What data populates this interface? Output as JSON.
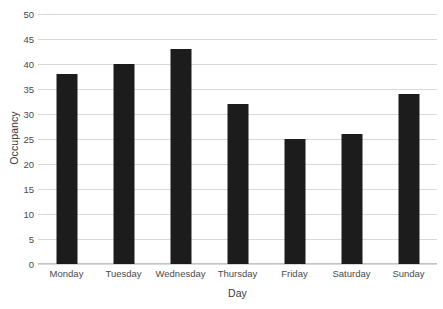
{
  "chart_data": {
    "type": "bar",
    "title": "",
    "xlabel": "Day",
    "ylabel": "Occupancy",
    "categories": [
      "Monday",
      "Tuesday",
      "Wednesday",
      "Thursday",
      "Friday",
      "Saturday",
      "Sunday"
    ],
    "values": [
      38,
      40,
      43,
      32,
      25,
      26,
      34
    ],
    "ylim": [
      0,
      50
    ],
    "yticks": [
      0,
      5,
      10,
      15,
      20,
      25,
      30,
      35,
      40,
      45,
      50
    ],
    "ytick_labels": [
      "0",
      "5",
      "10",
      "15",
      "20",
      "25",
      "30",
      "35",
      "40",
      "45",
      "50"
    ],
    "grid": "horizontal",
    "legend": "none",
    "bar_color": "#1c1c1c",
    "gridline_color": "#d9d9d9",
    "background_color": "#ffffff"
  }
}
